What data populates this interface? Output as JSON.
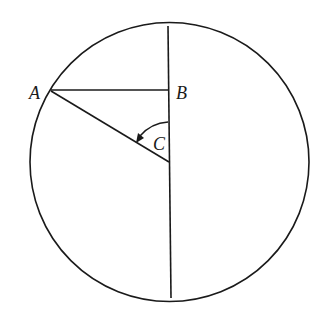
{
  "diagram": {
    "type": "geometry",
    "labels": {
      "A": "A",
      "B": "B",
      "C": "C"
    },
    "stroke_color": "#1a1a1a",
    "background": "#ffffff"
  }
}
